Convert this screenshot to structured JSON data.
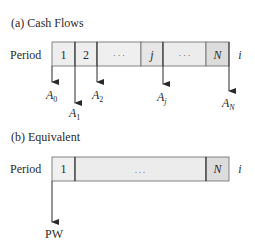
{
  "panel_a": {
    "title": "(a)   Cash Flows",
    "row_label": "Period",
    "cells": [
      "1",
      "2",
      "· · ·",
      "j",
      "· · ·",
      "N"
    ],
    "rate_label": "i",
    "flows": [
      {
        "label": "A",
        "sub": "0"
      },
      {
        "label": "A",
        "sub": "1"
      },
      {
        "label": "A",
        "sub": "2"
      },
      {
        "label": "A",
        "sub": "j"
      },
      {
        "label": "A",
        "sub": "N"
      }
    ]
  },
  "panel_b": {
    "title": "(b)   Equivalent",
    "row_label": "Period",
    "cells": [
      "1",
      ". . .",
      "N"
    ],
    "rate_label": "i",
    "flow_label": "PW"
  },
  "colors": {
    "cell_fill": "#ececec",
    "cell_fill_dark": "#dcdcdc",
    "stroke": "#2a2a2a"
  }
}
